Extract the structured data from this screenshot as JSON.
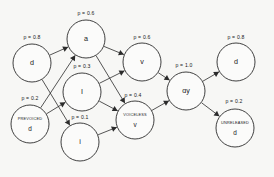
{
  "diagram": {
    "type": "directed-graph",
    "background_color": "#f7f7f5",
    "stroke_color": "#2b2b2b",
    "nodes": [
      {
        "id": "d_start",
        "symbol": "d",
        "feature": "",
        "prob_label": "p = 0.8",
        "cx": 32,
        "cy": 63,
        "r": 19,
        "prob_x": 32,
        "prob_y": 38
      },
      {
        "id": "prevoiced_d",
        "symbol": "d",
        "feature": "PREVOICED",
        "prob_label": "p = 0.2",
        "cx": 30,
        "cy": 124,
        "r": 19,
        "prob_x": 30,
        "prob_y": 99
      },
      {
        "id": "ah",
        "symbol": "a",
        "feature": "",
        "prob_label": "p = 0.6",
        "cx": 86,
        "cy": 39,
        "r": 19,
        "prob_x": 86,
        "prob_y": 14
      },
      {
        "id": "ih_cap",
        "symbol": "I",
        "feature": "",
        "prob_label": "p = 0.3",
        "cx": 82,
        "cy": 92,
        "r": 19,
        "prob_x": 82,
        "prob_y": 67
      },
      {
        "id": "i_low",
        "symbol": "i",
        "feature": "",
        "prob_label": "p = 0.1",
        "cx": 80,
        "cy": 142,
        "r": 19,
        "prob_x": 80,
        "prob_y": 118
      },
      {
        "id": "v",
        "symbol": "v",
        "feature": "",
        "prob_label": "p = 0.6",
        "cx": 142,
        "cy": 62,
        "r": 19,
        "prob_x": 142,
        "prob_y": 38
      },
      {
        "id": "voiceless_v",
        "symbol": "v",
        "feature": "VOICELESS",
        "prob_label": "p = 0.4",
        "cx": 135,
        "cy": 120,
        "r": 19,
        "prob_x": 133,
        "prob_y": 96
      },
      {
        "id": "ay",
        "symbol": "ɑy",
        "feature": "",
        "prob_label": "p = 1.0",
        "cx": 186,
        "cy": 91,
        "r": 19,
        "prob_x": 184,
        "prob_y": 66
      },
      {
        "id": "d_end",
        "symbol": "d",
        "feature": "",
        "prob_label": "p = 0.8",
        "cx": 236,
        "cy": 62,
        "r": 19,
        "prob_x": 236,
        "prob_y": 38
      },
      {
        "id": "unreleased_d",
        "symbol": "d",
        "feature": "UNRELEASED",
        "prob_label": "p = 0.2",
        "cx": 235,
        "cy": 128,
        "r": 19,
        "prob_x": 234,
        "prob_y": 102
      }
    ],
    "edges": [
      {
        "from": "d_start",
        "to": "ah"
      },
      {
        "from": "d_start",
        "to": "i_low"
      },
      {
        "from": "prevoiced_d",
        "to": "ah"
      },
      {
        "from": "prevoiced_d",
        "to": "ih_cap"
      },
      {
        "from": "ah",
        "to": "v"
      },
      {
        "from": "ah",
        "to": "voiceless_v"
      },
      {
        "from": "ih_cap",
        "to": "v"
      },
      {
        "from": "ih_cap",
        "to": "voiceless_v"
      },
      {
        "from": "i_low",
        "to": "voiceless_v"
      },
      {
        "from": "v",
        "to": "ay"
      },
      {
        "from": "voiceless_v",
        "to": "ay"
      },
      {
        "from": "ay",
        "to": "d_end"
      },
      {
        "from": "ay",
        "to": "unreleased_d"
      }
    ]
  }
}
